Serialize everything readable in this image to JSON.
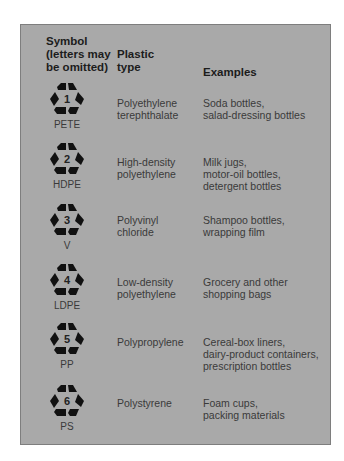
{
  "header": {
    "symbol_lines": [
      "Symbol",
      "(letters may",
      "be omitted)"
    ],
    "plastic_lines": [
      "Plastic",
      "type"
    ],
    "examples": "Examples"
  },
  "rows": [
    {
      "number": "1",
      "code": "PETE",
      "plastic": [
        "Polyethylene",
        "terephthalate"
      ],
      "examples": [
        "Soda bottles,",
        "salad-dressing bottles"
      ]
    },
    {
      "number": "2",
      "code": "HDPE",
      "plastic": [
        "High-density",
        "polyethylene"
      ],
      "examples": [
        "Milk jugs,",
        "motor-oil bottles,",
        "detergent bottles"
      ]
    },
    {
      "number": "3",
      "code": "V",
      "plastic": [
        "Polyvinyl",
        "chloride"
      ],
      "examples": [
        "Shampoo bottles,",
        "wrapping film"
      ]
    },
    {
      "number": "4",
      "code": "LDPE",
      "plastic": [
        "Low-density",
        "polyethylene"
      ],
      "examples": [
        "Grocery and other",
        "shopping bags"
      ]
    },
    {
      "number": "5",
      "code": "PP",
      "plastic": [
        "Polypropylene"
      ],
      "examples": [
        "Cereal-box liners,",
        "dairy-product containers,",
        "prescription bottles"
      ]
    },
    {
      "number": "6",
      "code": "PS",
      "plastic": [
        "Polystyrene"
      ],
      "examples": [
        "Foam cups,",
        "packing materials"
      ]
    }
  ],
  "colors": {
    "panel_bg": "#a9a9a9",
    "panel_border": "#7e7e7e",
    "header_text": "#1c1c1c",
    "body_text": "#3a3a3a",
    "icon": "#111111"
  }
}
